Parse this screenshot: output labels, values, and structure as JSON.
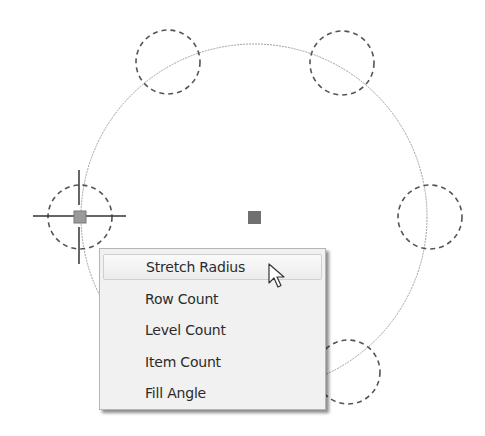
{
  "canvas": {
    "description": "AutoCAD polar array with grip context menu",
    "array_center_grip": "center-grip",
    "base_grip": "active-radius-grip",
    "item_count_visible": 5
  },
  "context_menu": {
    "items": [
      {
        "label": "Stretch Radius",
        "hovered": true
      },
      {
        "label": "Row Count",
        "hovered": false
      },
      {
        "label": "Level Count",
        "hovered": false
      },
      {
        "label": "Item Count",
        "hovered": false
      },
      {
        "label": "Fill Angle",
        "hovered": false
      }
    ]
  },
  "colors": {
    "path_circle": "#9a9a9a",
    "dashed_items": "#555555",
    "grip": "#6e6e6e",
    "menu_bg": "#f1f1f1",
    "menu_text": "#2b2b2b"
  },
  "cursor": {
    "icon": "arrow-pointer-icon"
  }
}
